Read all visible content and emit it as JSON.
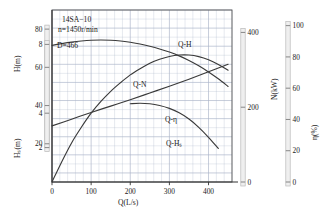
{
  "figure": {
    "title_lines": [
      "14SA−10",
      "n=1450r/min"
    ],
    "impeller_note": "D=466",
    "background": "#ffffff",
    "grid_color": "#aab4c8",
    "curve_color": "#3a3a3a",
    "axis_bar_color": "#b9b9b9"
  },
  "axes": {
    "x": {
      "label": "Q(L/s)",
      "ticks": [
        0,
        100,
        200,
        300,
        400
      ],
      "min": 0,
      "max": 460,
      "minor_step": 20
    },
    "h": {
      "label": "H(m)",
      "ticks": [
        20,
        40,
        60,
        80
      ],
      "min": 0,
      "max": 90
    },
    "hs": {
      "label": "Hₛ(m)",
      "ticks": [
        2,
        4,
        8
      ],
      "min": 0,
      "max": 10
    },
    "n": {
      "label": "N(kW)",
      "ticks": [
        0,
        200,
        400
      ],
      "min": 0,
      "max": 460
    },
    "eta": {
      "label": "η(%)",
      "ticks": [
        0,
        20,
        40,
        60,
        80,
        100
      ],
      "min": 0,
      "max": 110
    }
  },
  "chart_data": {
    "type": "line",
    "title": "14SA−10  n=1450r/min  D=466",
    "xlabel": "Q(L/s)",
    "ylabel": "H(m)",
    "xlim": [
      0,
      460
    ],
    "grid": true,
    "legend": "inline-labels",
    "series": [
      {
        "name": "Q-H",
        "label": "Q‑H",
        "axis": "h",
        "ylabel": "H(m)",
        "ylim": [
          0,
          90
        ],
        "x": [
          0,
          25,
          50,
          75,
          100,
          125,
          150,
          175,
          200,
          225,
          250,
          275,
          300,
          325,
          350,
          375,
          400,
          425,
          450
        ],
        "y": [
          71.5,
          72.4,
          73.2,
          73.8,
          74.2,
          74.3,
          74.2,
          73.8,
          73.1,
          72.2,
          71.0,
          69.6,
          68.0,
          66.0,
          63.6,
          60.8,
          57.6,
          54.0,
          50.0
        ]
      },
      {
        "name": "Q-N",
        "label": "Q‑N",
        "axis": "n",
        "ylabel": "N(kW)",
        "ylim": [
          0,
          460
        ],
        "x": [
          0,
          50,
          100,
          150,
          200,
          250,
          300,
          350,
          400,
          450
        ],
        "y": [
          150,
          168,
          186,
          203,
          220,
          238,
          256,
          275,
          295,
          315
        ]
      },
      {
        "name": "Q-eta",
        "label": "Q‑η",
        "axis": "eta",
        "ylabel": "η(%)",
        "ylim": [
          0,
          110
        ],
        "x": [
          0,
          25,
          50,
          75,
          100,
          125,
          150,
          175,
          200,
          225,
          250,
          275,
          300,
          325,
          350,
          375,
          400,
          425,
          450
        ],
        "y": [
          0,
          13,
          25,
          35,
          44,
          51.5,
          58,
          63.5,
          68.5,
          72.5,
          76,
          78.5,
          80.3,
          81.2,
          81.2,
          80.2,
          78.2,
          75.2,
          71.5
        ]
      },
      {
        "name": "Q-Hs",
        "label": "Q‑Hₛ",
        "axis": "hs",
        "ylabel": "Hₛ(m)",
        "ylim": [
          0,
          10
        ],
        "x": [
          200,
          225,
          250,
          275,
          300,
          325,
          350,
          375,
          400,
          425
        ],
        "y": [
          4.55,
          4.58,
          4.55,
          4.45,
          4.28,
          4.02,
          3.66,
          3.18,
          2.6,
          1.95
        ]
      }
    ]
  }
}
